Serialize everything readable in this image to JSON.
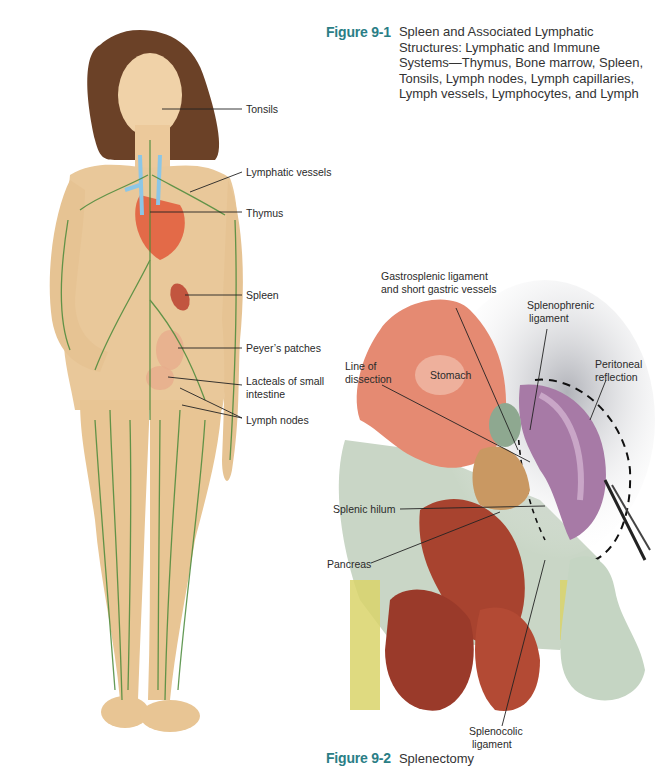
{
  "figure1": {
    "number": "Figure 9-1",
    "caption": [
      "Spleen and Associated Lymphatic",
      "Structures: Lymphatic and Immune",
      "Systems—Thymus, Bone marrow, Spleen,",
      "Tonsils, Lymph nodes, Lymph capillaries,",
      "Lymph vessels, Lymphocytes, and Lymph"
    ],
    "labels": {
      "tonsils": "Tonsils",
      "lymphatic_vessels": "Lymphatic vessels",
      "thymus": "Thymus",
      "spleen": "Spleen",
      "peyers_patches": "Peyer’s patches",
      "lacteals_1": "Lacteals of small",
      "lacteals_2": "intestine",
      "lymph_nodes": "Lymph nodes"
    }
  },
  "figure2": {
    "number": "Figure 9-2",
    "caption": "Splenectomy",
    "labels": {
      "gastrosplenic_1": "Gastrosplenic ligament",
      "gastrosplenic_2": "and short gastric vessels",
      "splenophrenic_1": "Splenophrenic",
      "splenophrenic_2": "ligament",
      "line_of_dissection_1": "Line of",
      "line_of_dissection_2": "dissection",
      "stomach": "Stomach",
      "peritoneal_1": "Peritoneal",
      "peritoneal_2": "reflection",
      "splenic_hilum": "Splenic hilum",
      "pancreas": "Pancreas",
      "splenocolic_1": "Splenocolic",
      "splenocolic_2": "ligament"
    }
  },
  "colors": {
    "figure_number": "#2a7e86",
    "skin": "#e9c89a",
    "lymph_green": "#4a8a3a",
    "stomach": "#e58a72",
    "spleen": "#a77aa6",
    "intestine": "#a8432f",
    "omentum": "#c9d6c6"
  }
}
